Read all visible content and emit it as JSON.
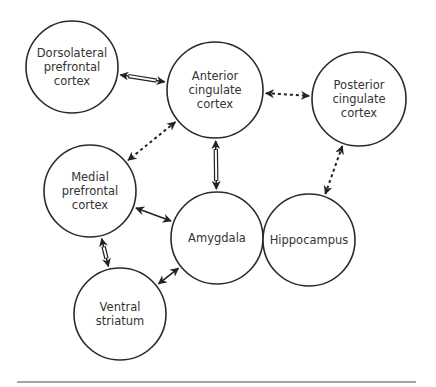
{
  "diagram": {
    "type": "brain-region-network",
    "colors": {
      "stroke": "#2a2a2a",
      "text": "#333333",
      "rule": "#888888",
      "background": "#ffffff"
    },
    "nodes": [
      {
        "id": "dlpfc",
        "lines": [
          "Dorsolateral",
          "prefrontal",
          "cortex"
        ],
        "cx": 72,
        "cy": 67,
        "r": 46
      },
      {
        "id": "acc",
        "lines": [
          "Anterior",
          "cingulate",
          "cortex"
        ],
        "cx": 215,
        "cy": 90,
        "r": 48
      },
      {
        "id": "pcc",
        "lines": [
          "Posterior",
          "cingulate",
          "cortex"
        ],
        "cx": 359,
        "cy": 99,
        "r": 47
      },
      {
        "id": "mpfc",
        "lines": [
          "Medial",
          "prefrontal",
          "cortex"
        ],
        "cx": 90,
        "cy": 191,
        "r": 46
      },
      {
        "id": "amygdala",
        "lines": [
          "Amygdala"
        ],
        "cx": 217,
        "cy": 238,
        "r": 46
      },
      {
        "id": "hippocampus",
        "lines": [
          "Hippocampus"
        ],
        "cx": 309,
        "cy": 240,
        "r": 46
      },
      {
        "id": "vstriatum",
        "lines": [
          "Ventral",
          "striatum"
        ],
        "cx": 120,
        "cy": 314,
        "r": 46
      }
    ],
    "edges": [
      {
        "from": "dlpfc",
        "to": "acc",
        "style": "double-line",
        "direction": "bidirectional"
      },
      {
        "from": "acc",
        "to": "pcc",
        "style": "dashed",
        "direction": "bidirectional"
      },
      {
        "from": "acc",
        "to": "mpfc",
        "style": "dashed",
        "direction": "bidirectional"
      },
      {
        "from": "acc",
        "to": "amygdala",
        "style": "double-line",
        "direction": "bidirectional"
      },
      {
        "from": "pcc",
        "to": "hippocampus",
        "style": "dashed",
        "direction": "bidirectional"
      },
      {
        "from": "mpfc",
        "to": "amygdala",
        "style": "solid",
        "direction": "bidirectional"
      },
      {
        "from": "mpfc",
        "to": "vstriatum",
        "style": "double-line",
        "direction": "bidirectional"
      },
      {
        "from": "vstriatum",
        "to": "amygdala",
        "style": "solid",
        "direction": "bidirectional"
      }
    ],
    "bottom_rule": {
      "x1": 17,
      "x2": 416,
      "y": 382
    }
  }
}
